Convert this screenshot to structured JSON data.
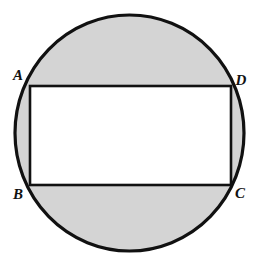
{
  "figure": {
    "kind": "geometry-diagram",
    "background_color": "#ffffff",
    "shaded_color": "#d4d4d4",
    "outline_color": "#111111",
    "rectangle_fill": "#ffffff",
    "circle": {
      "name": "circumscribed-circle",
      "center_x": 129.5,
      "center_y": 133,
      "radius_x": 114.5,
      "radius_y": 118,
      "stroke_width": 3.2
    },
    "rectangle": {
      "name": "inscribed-rectangle",
      "left": 30,
      "top": 86,
      "right": 231,
      "bottom": 185,
      "width": 201,
      "height": 99,
      "stroke_width": 2.6
    },
    "labels": [
      {
        "id": "A",
        "text": "A",
        "x": 18,
        "y": 80,
        "anchor": "middle",
        "corner": "top-left"
      },
      {
        "id": "D",
        "text": "D",
        "x": 241,
        "y": 85,
        "anchor": "middle",
        "corner": "top-right"
      },
      {
        "id": "B",
        "text": "B",
        "x": 18,
        "y": 199,
        "anchor": "middle",
        "corner": "bottom-left"
      },
      {
        "id": "C",
        "text": "C",
        "x": 240,
        "y": 198,
        "anchor": "middle",
        "corner": "bottom-right"
      }
    ]
  }
}
